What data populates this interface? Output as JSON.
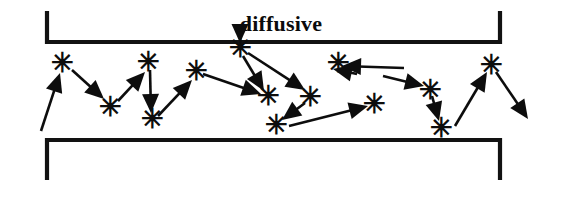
{
  "figure": {
    "title": "diffusive",
    "title_position": {
      "x": 281,
      "y": 31
    },
    "background_color": "#ffffff",
    "ink_color": "#0d0d0d",
    "wall_color": "#121212",
    "scatter_marker_glyph": "✳",
    "scatter_marker_name": "asterisk-scattering-event",
    "width": 564,
    "height": 206
  },
  "walls": {
    "top_wall_name": "top-boundary-wall",
    "top_wall_path": "M 47 11 L 47 42 L 500 42 L 500 11",
    "bottom_wall_name": "bottom-boundary-wall",
    "bottom_wall_path": "M 47 180 L 47 140 L 500 140 L 500 180"
  },
  "scatter_points": [
    {
      "id": "s1",
      "x": 62,
      "y": 63
    },
    {
      "id": "s2",
      "x": 110,
      "y": 107
    },
    {
      "id": "s3",
      "x": 148,
      "y": 62
    },
    {
      "id": "s4",
      "x": 152,
      "y": 119
    },
    {
      "id": "s5",
      "x": 196,
      "y": 71
    },
    {
      "id": "s6",
      "x": 240,
      "y": 48
    },
    {
      "id": "s7",
      "x": 268,
      "y": 96
    },
    {
      "id": "s8",
      "x": 310,
      "y": 97
    },
    {
      "id": "s9",
      "x": 276,
      "y": 125
    },
    {
      "id": "s10",
      "x": 338,
      "y": 63
    },
    {
      "id": "s11",
      "x": 374,
      "y": 104
    },
    {
      "id": "s12",
      "x": 430,
      "y": 90
    },
    {
      "id": "s13",
      "x": 441,
      "y": 128
    },
    {
      "id": "s14",
      "x": 491,
      "y": 65
    }
  ],
  "trajectory_segments": [
    {
      "id": "a1",
      "name": "arrow-into-scatter-1",
      "x1": 41,
      "y1": 131,
      "x2": 60,
      "y2": 73
    },
    {
      "id": "a2",
      "name": "arrow-scatter1-to-scatter2",
      "x1": 72,
      "y1": 70,
      "x2": 104,
      "y2": 99
    },
    {
      "id": "a3",
      "name": "arrow-scatter2-to-scatter3",
      "x1": 118,
      "y1": 101,
      "x2": 145,
      "y2": 72
    },
    {
      "id": "a4",
      "name": "arrow-scatter3-to-scatter4",
      "x1": 150,
      "y1": 70,
      "x2": 151,
      "y2": 113
    },
    {
      "id": "a5",
      "name": "arrow-scatter4-to-scatter5",
      "x1": 158,
      "y1": 116,
      "x2": 192,
      "y2": 80
    },
    {
      "id": "a6",
      "name": "arrow-scatter5-to-scatter7",
      "x1": 203,
      "y1": 74,
      "x2": 261,
      "y2": 94
    },
    {
      "id": "a7",
      "name": "arrow-wall-to-scatter6",
      "x1": 240,
      "y1": 26,
      "x2": 240,
      "y2": 43
    },
    {
      "id": "a8",
      "name": "arrow-scatter6-to-scatter8",
      "x1": 248,
      "y1": 53,
      "x2": 305,
      "y2": 90
    },
    {
      "id": "a9",
      "name": "arrow-scatter6-to-scatter7",
      "x1": 243,
      "y1": 56,
      "x2": 264,
      "y2": 91
    },
    {
      "id": "a10",
      "name": "arrow-scatter8-to-scatter9",
      "x1": 305,
      "y1": 103,
      "x2": 282,
      "y2": 120
    },
    {
      "id": "a11",
      "name": "arrow-scatter9-to-scatter11",
      "x1": 289,
      "y1": 126,
      "x2": 368,
      "y2": 106
    },
    {
      "id": "a12",
      "name": "arrow-scatter10-to-wallside",
      "x1": 357,
      "y1": 74,
      "x2": 333,
      "y2": 69
    },
    {
      "id": "a13",
      "name": "arrow-scatter10-sideline",
      "x1": 404,
      "y1": 68,
      "x2": 342,
      "y2": 66
    },
    {
      "id": "a14",
      "name": "arrow-scatter11-to-scatter12",
      "x1": 383,
      "y1": 76,
      "x2": 424,
      "y2": 86
    },
    {
      "id": "a15",
      "name": "arrow-scatter12-to-scatter13",
      "x1": 432,
      "y1": 96,
      "x2": 439,
      "y2": 121
    },
    {
      "id": "a16",
      "name": "arrow-scatter13-to-scatter14",
      "x1": 455,
      "y1": 126,
      "x2": 487,
      "y2": 72
    },
    {
      "id": "a17",
      "name": "arrow-scatter14-outgoing",
      "x1": 496,
      "y1": 72,
      "x2": 528,
      "y2": 119
    }
  ]
}
